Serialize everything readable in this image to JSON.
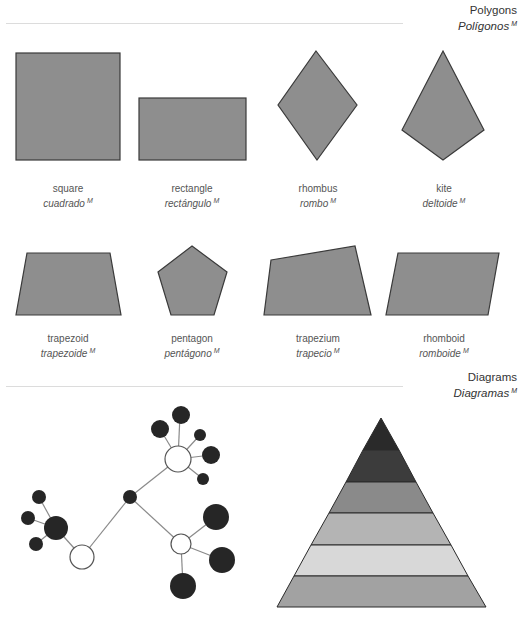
{
  "sections": {
    "polygons": {
      "title_en": "Polygons",
      "title_es": "Polígonos",
      "gender_mark": "M"
    },
    "diagrams": {
      "title_en": "Diagrams",
      "title_es": "Diagramas",
      "gender_mark": "M"
    }
  },
  "shapes": [
    {
      "en": "square",
      "es": "cuadrado",
      "mark": "M"
    },
    {
      "en": "rectangle",
      "es": "rectángulo",
      "mark": "M"
    },
    {
      "en": "rhombus",
      "es": "rombo",
      "mark": "M"
    },
    {
      "en": "kite",
      "es": "deltoide",
      "mark": "M"
    },
    {
      "en": "trapezoid",
      "es": "trapezoide",
      "mark": "M"
    },
    {
      "en": "pentagon",
      "es": "pentágono",
      "mark": "M"
    },
    {
      "en": "trapezium",
      "es": "trapecio",
      "mark": "M"
    },
    {
      "en": "rhomboid",
      "es": "romboide",
      "mark": "M"
    }
  ],
  "colors": {
    "shape_fill": "#8e8e8e",
    "shape_stroke": "#3a3a3a",
    "node_dark": "#262626",
    "node_light": "#ffffff",
    "edge": "#8a8a8a",
    "pyramid_bands": [
      "#2a2a2a",
      "#3c3c3c",
      "#8a8a8a",
      "#b4b4b4",
      "#d6d6d6",
      "#a2a2a2"
    ]
  }
}
